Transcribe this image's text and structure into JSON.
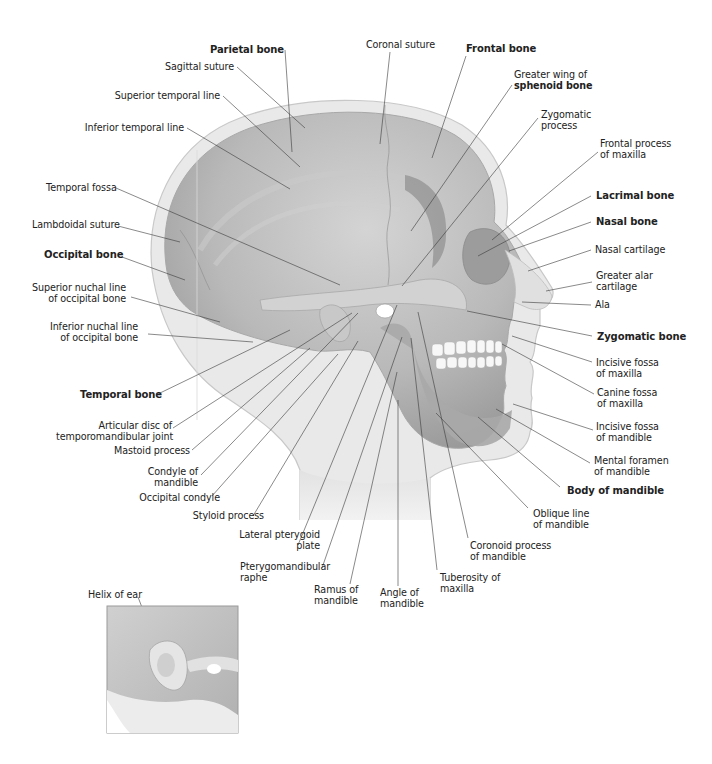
{
  "figure": {
    "type": "anatomical-diagram",
    "labels": [
      {
        "id": "parietal-bone",
        "text": "Parietal bone",
        "bold": true,
        "x": 204,
        "y": 45,
        "w": 80,
        "align": "right",
        "line": [
          285,
          50,
          292,
          152
        ]
      },
      {
        "id": "sagittal-suture",
        "text": "Sagittal suture",
        "bold": false,
        "x": 152,
        "y": 62,
        "w": 82,
        "align": "right",
        "line": [
          237,
          67,
          305,
          128
        ]
      },
      {
        "id": "superior-temporal-line",
        "text": "Superior temporal line",
        "bold": false,
        "x": 100,
        "y": 91,
        "w": 120,
        "align": "right",
        "line": [
          223,
          96,
          300,
          167
        ]
      },
      {
        "id": "inferior-temporal-line",
        "text": "Inferior temporal line",
        "bold": false,
        "x": 62,
        "y": 123,
        "w": 122,
        "align": "right",
        "line": [
          187,
          128,
          290,
          189
        ]
      },
      {
        "id": "temporal-fossa",
        "text": "Temporal fossa",
        "bold": false,
        "x": 46,
        "y": 183,
        "w": 66,
        "align": "right",
        "line": [
          116,
          188,
          340,
          285
        ]
      },
      {
        "id": "lambdoidal-suture",
        "text": "Lambdoidal suture",
        "bold": false,
        "x": 32,
        "y": 220,
        "w": 84,
        "align": "right",
        "line": [
          118,
          226,
          180,
          242
        ]
      },
      {
        "id": "occipital-bone",
        "text": "Occipital bone",
        "bold": true,
        "x": 44,
        "y": 250,
        "w": 72,
        "align": "right",
        "line": [
          122,
          257,
          185,
          280
        ]
      },
      {
        "id": "superior-nuchal-line",
        "text": "Superior nuchal line\nof occipital bone",
        "bold": false,
        "x": 18,
        "y": 283,
        "w": 108,
        "align": "right",
        "line": [
          131,
          297,
          220,
          322
        ]
      },
      {
        "id": "inferior-nuchal-line",
        "text": "Inferior nuchal line\nof occipital bone",
        "bold": false,
        "x": 30,
        "y": 322,
        "w": 108,
        "align": "right",
        "line": [
          148,
          334,
          253,
          342
        ]
      },
      {
        "id": "temporal-bone",
        "text": "Temporal bone",
        "bold": true,
        "x": 80,
        "y": 390,
        "w": 72,
        "align": "right",
        "line": [
          158,
          394,
          290,
          330
        ]
      },
      {
        "id": "articular-disc",
        "text": "Articular disc of\ntemporomandibular joint",
        "bold": false,
        "x": 56,
        "y": 421,
        "w": 116,
        "align": "right",
        "line": [
          173,
          428,
          352,
          313
        ]
      },
      {
        "id": "mastoid-process",
        "text": "Mastoid process",
        "bold": false,
        "x": 112,
        "y": 446,
        "w": 78,
        "align": "right",
        "line": [
          192,
          450,
          310,
          348
        ]
      },
      {
        "id": "condyle-of-mandible",
        "text": "Condyle of\nmandible",
        "bold": false,
        "x": 144,
        "y": 467,
        "w": 54,
        "align": "right",
        "line": [
          201,
          475,
          358,
          313
        ]
      },
      {
        "id": "occipital-condyle",
        "text": "Occipital condyle",
        "bold": false,
        "x": 132,
        "y": 493,
        "w": 88,
        "align": "right",
        "line": [
          212,
          496,
          338,
          354
        ]
      },
      {
        "id": "styloid-process",
        "text": "Styloid process",
        "bold": false,
        "x": 184,
        "y": 511,
        "w": 80,
        "align": "right",
        "line": [
          253,
          516,
          358,
          341
        ]
      },
      {
        "id": "lateral-pterygoid-plate",
        "text": "Lateral pterygoid\nplate",
        "bold": false,
        "x": 236,
        "y": 530,
        "w": 84,
        "align": "right",
        "line": [
          298,
          545,
          397,
          305
        ]
      },
      {
        "id": "pterygomandibular-raphe",
        "text": "Pterygomandibular\nraphe",
        "bold": false,
        "x": 240,
        "y": 562,
        "w": 94,
        "align": "left",
        "line": [
          322,
          568,
          402,
          337
        ]
      },
      {
        "id": "ramus-of-mandible",
        "text": "Ramus of\nmandible",
        "bold": false,
        "x": 314,
        "y": 585,
        "w": 56,
        "align": "left",
        "line": [
          350,
          584,
          397,
          372
        ]
      },
      {
        "id": "angle-of-mandible",
        "text": "Angle of\nmandible",
        "bold": false,
        "x": 380,
        "y": 588,
        "w": 52,
        "align": "left",
        "line": [
          398,
          586,
          398,
          400
        ]
      },
      {
        "id": "tuberosity-of-maxilla",
        "text": "Tuberosity of\nmaxilla",
        "bold": false,
        "x": 440,
        "y": 573,
        "w": 70,
        "align": "left",
        "line": [
          437,
          570,
          411,
          338
        ]
      },
      {
        "id": "coronoid-process",
        "text": "Coronoid process\nof mandible",
        "bold": false,
        "x": 470,
        "y": 541,
        "w": 90,
        "align": "left",
        "line": [
          468,
          538,
          418,
          312
        ]
      },
      {
        "id": "oblique-line",
        "text": "Oblique line\nof mandible",
        "bold": false,
        "x": 533,
        "y": 509,
        "w": 70,
        "align": "left",
        "line": [
          528,
          508,
          436,
          413
        ]
      },
      {
        "id": "body-of-mandible",
        "text": "Body of mandible",
        "bold": true,
        "x": 567,
        "y": 486,
        "w": 110,
        "align": "left",
        "line": [
          560,
          487,
          478,
          417
        ]
      },
      {
        "id": "mental-foramen",
        "text": "Mental foramen\nof mandible",
        "bold": false,
        "x": 594,
        "y": 456,
        "w": 88,
        "align": "left",
        "line": [
          590,
          463,
          496,
          409
        ]
      },
      {
        "id": "incisive-fossa-mandible",
        "text": "Incisive fossa\nof mandible",
        "bold": false,
        "x": 596,
        "y": 422,
        "w": 80,
        "align": "left",
        "line": [
          593,
          430,
          513,
          404
        ]
      },
      {
        "id": "canine-fossa-maxilla",
        "text": "Canine fossa\nof maxilla",
        "bold": false,
        "x": 597,
        "y": 388,
        "w": 76,
        "align": "left",
        "line": [
          594,
          394,
          502,
          344
        ]
      },
      {
        "id": "incisive-fossa-maxilla",
        "text": "Incisive fossa\nof maxilla",
        "bold": false,
        "x": 596,
        "y": 358,
        "w": 80,
        "align": "left",
        "line": [
          592,
          362,
          512,
          336
        ]
      },
      {
        "id": "zygomatic-bone",
        "text": "Zygomatic bone",
        "bold": true,
        "x": 597,
        "y": 332,
        "w": 100,
        "align": "left",
        "line": [
          592,
          336,
          467,
          311
        ]
      },
      {
        "id": "ala",
        "text": "Ala",
        "bold": false,
        "x": 595,
        "y": 300,
        "w": 30,
        "align": "left",
        "line": [
          591,
          305,
          522,
          302
        ]
      },
      {
        "id": "greater-alar-cartilage",
        "text": "Greater alar\ncartilage",
        "bold": false,
        "x": 596,
        "y": 271,
        "w": 70,
        "align": "left",
        "line": [
          592,
          282,
          546,
          291
        ]
      },
      {
        "id": "nasal-cartilage",
        "text": "Nasal cartilage",
        "bold": false,
        "x": 595,
        "y": 245,
        "w": 84,
        "align": "left",
        "line": [
          591,
          250,
          528,
          271
        ]
      },
      {
        "id": "nasal-bone",
        "text": "Nasal bone",
        "bold": true,
        "x": 596,
        "y": 217,
        "w": 72,
        "align": "left",
        "line": [
          591,
          222,
          509,
          251
        ]
      },
      {
        "id": "lacrimal-bone",
        "text": "Lacrimal bone",
        "bold": true,
        "x": 596,
        "y": 191,
        "w": 84,
        "align": "left",
        "line": [
          591,
          196,
          478,
          256
        ]
      },
      {
        "id": "frontal-process-maxilla",
        "text": "Frontal process\nof maxilla",
        "bold": false,
        "x": 600,
        "y": 139,
        "w": 82,
        "align": "left",
        "line": [
          598,
          152,
          492,
          240
        ]
      },
      {
        "id": "zygomatic-process",
        "text": "Zygomatic\nprocess",
        "bold": false,
        "x": 541,
        "y": 110,
        "w": 60,
        "align": "left",
        "line": [
          538,
          118,
          402,
          286
        ]
      },
      {
        "id": "greater-wing-sphenoid",
        "text": "Greater wing of\n",
        "bold_suffix": "sphenoid bone",
        "bold": false,
        "x": 514,
        "y": 70,
        "w": 90,
        "align": "left",
        "line": [
          512,
          85,
          411,
          231
        ]
      },
      {
        "id": "frontal-bone",
        "text": "Frontal bone",
        "bold": true,
        "x": 466,
        "y": 44,
        "w": 80,
        "align": "left",
        "line": [
          466,
          56,
          432,
          158
        ]
      },
      {
        "id": "coronal-suture",
        "text": "Coronal suture",
        "bold": false,
        "x": 366,
        "y": 40,
        "w": 80,
        "align": "left",
        "line": [
          390,
          52,
          380,
          144
        ]
      },
      {
        "id": "helix-of-ear",
        "text": "Helix of ear",
        "bold": false,
        "x": 88,
        "y": 590,
        "w": 64,
        "align": "left",
        "line": [
          138,
          597,
          156,
          644
        ]
      }
    ],
    "inset": {
      "label_ref": "helix-of-ear",
      "description": "Close-up of ear region"
    }
  },
  "colors": {
    "background": "#ffffff",
    "skin": "#e6e6e6",
    "skin_outline": "#c4c4c4",
    "skull": "#b4b4b4",
    "skull_dark": "#9a9a9a",
    "skull_light": "#cfcfcf",
    "teeth": "#f6f6f6",
    "leader": "#3a3a3a"
  }
}
